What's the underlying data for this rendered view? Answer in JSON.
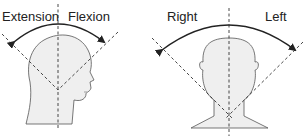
{
  "left_panel": {
    "labels": {
      "extension": "Extension",
      "flexion": "Flexion"
    },
    "subject": "head-profile-side-view"
  },
  "right_panel": {
    "labels": {
      "right": "Right",
      "left": "Left"
    },
    "subject": "head-front-view"
  },
  "colors": {
    "skin": "#efefef",
    "outline": "#555555",
    "line": "#333333"
  }
}
